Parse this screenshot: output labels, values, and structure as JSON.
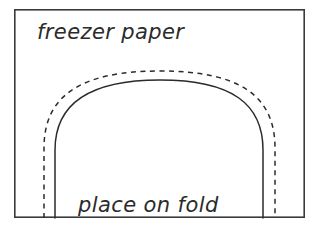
{
  "diagram": {
    "kind": "sewing-pattern-template",
    "background_color": "#ffffff",
    "ink_color": "#2b2b2b",
    "frame_color": "#3a3a3a",
    "labels": {
      "top": "freezer paper",
      "bottom": "place on fold"
    },
    "frame": {
      "x": 14,
      "y": 9,
      "width": 291,
      "height": 209,
      "stroke_width": 1.6
    },
    "shapes": [
      {
        "name": "cut-line",
        "style": "solid",
        "stroke_width": 1.5,
        "description": "solid arch outline, cutting line",
        "path": "M 55 218 L 55 150 C 55 104 88 80 160 80 C 232 80 263 104 263 150 L 263 218"
      },
      {
        "name": "seam-allowance-line",
        "style": "dashed",
        "stroke_width": 1.5,
        "dash_pattern": "5 4.5",
        "description": "dashed arch offset outside the cut line, seam allowance",
        "path": "M 44 218 L 44 148 C 44 96 80 71 160 71 C 240 71 275 96 275 148 L 275 218"
      }
    ],
    "label_positions": {
      "top": {
        "x": 37,
        "y": 39
      },
      "bottom": {
        "x": 78,
        "y": 212
      }
    }
  }
}
